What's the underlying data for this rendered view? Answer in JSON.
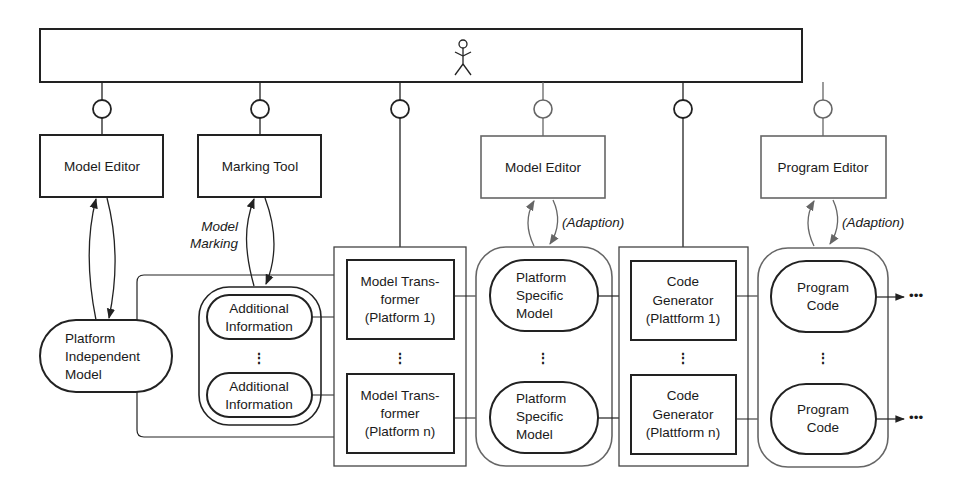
{
  "diagram": {
    "actor_bar": {
      "icon": "stick-figure-user-icon"
    },
    "tools": [
      {
        "id": "model-editor-1",
        "label": "Model Editor"
      },
      {
        "id": "marking-tool",
        "label": "Marking Tool"
      },
      {
        "id": "model-editor-2",
        "label": "Model Editor"
      },
      {
        "id": "program-editor",
        "label": "Program Editor"
      }
    ],
    "edge_labels": {
      "model_marking_line1": "Model",
      "model_marking_line2": "Marking",
      "adaption_1": "(Adaption)",
      "adaption_2": "(Adaption)"
    },
    "pim": {
      "lines": [
        "Platform",
        "Independent",
        "Model"
      ]
    },
    "additional_info": [
      {
        "lines": [
          "Additional",
          "Information"
        ]
      },
      {
        "lines": [
          "Additional",
          "Information"
        ]
      }
    ],
    "transformers": [
      {
        "lines": [
          "Model Trans-",
          "former",
          "(Platform 1)"
        ]
      },
      {
        "lines": [
          "Model Trans-",
          "former",
          "(Platform n)"
        ]
      }
    ],
    "psm": [
      {
        "lines": [
          "Platform",
          "Specific",
          "Model"
        ]
      },
      {
        "lines": [
          "Platform",
          "Specific",
          "Model"
        ]
      }
    ],
    "generators": [
      {
        "lines": [
          "Code",
          "Generator",
          "(Plattform 1)"
        ]
      },
      {
        "lines": [
          "Code",
          "Generator",
          "(Plattform n)"
        ]
      }
    ],
    "program_code": [
      {
        "lines": [
          "Program",
          "Code"
        ]
      },
      {
        "lines": [
          "Program",
          "Code"
        ]
      }
    ],
    "continuation": "•••",
    "vertical_ellipsis": "⋮"
  }
}
